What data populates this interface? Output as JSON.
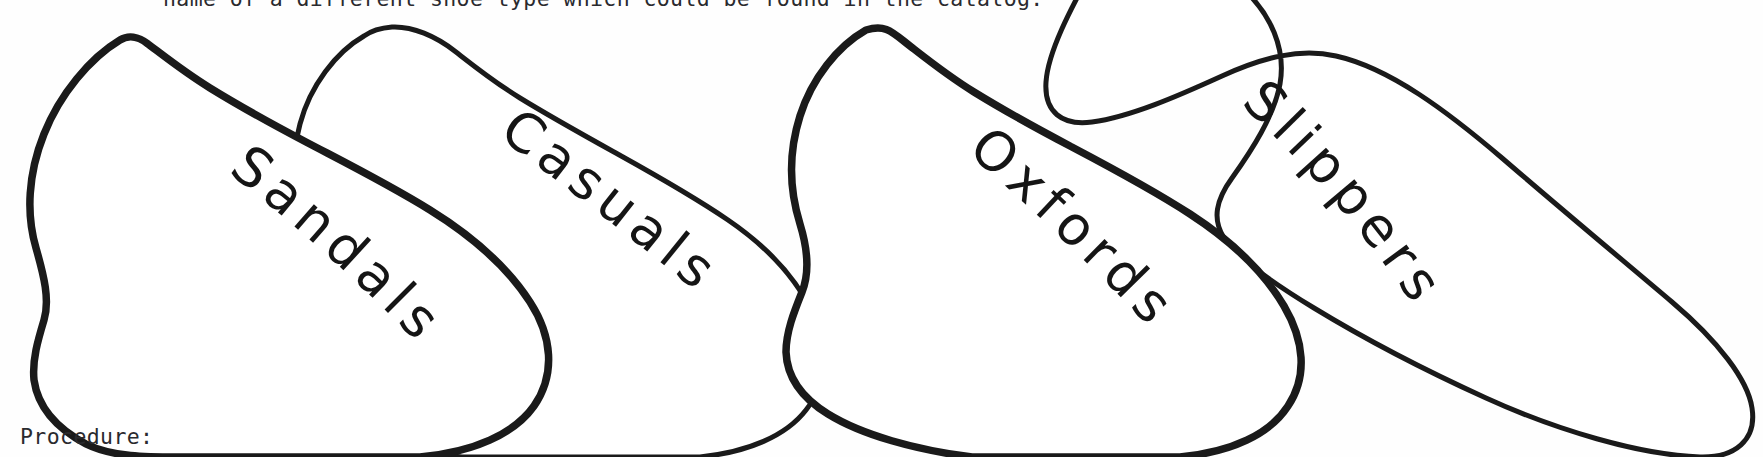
{
  "document": {
    "instruction_text": "name of a different shoe type which could be found in the catalog.",
    "procedure_label": "Procedure:",
    "background_color": "#ffffff",
    "ink_color": "#1a1a1a"
  },
  "shoes": [
    {
      "label": "Sandals",
      "order": 1,
      "stroke_width": 7,
      "label_rotation_deg": 48
    },
    {
      "label": "Casuals",
      "order": 2,
      "stroke_width": 5,
      "label_rotation_deg": 48
    },
    {
      "label": "Oxfords",
      "order": 3,
      "stroke_width": 7,
      "label_rotation_deg": 58
    },
    {
      "label": "Slippers",
      "order": 4,
      "stroke_width": 5,
      "label_rotation_deg": 62
    }
  ]
}
